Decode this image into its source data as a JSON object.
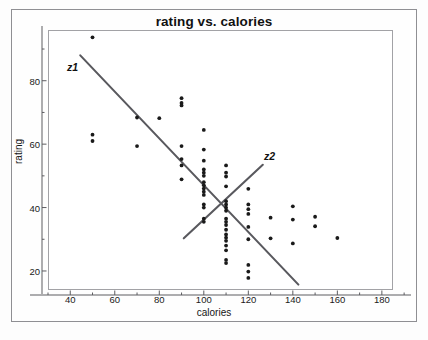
{
  "chart_data": {
    "type": "scatter",
    "title": "rating vs. calories",
    "xlabel": "calories",
    "ylabel": "rating",
    "xlim": [
      30,
      185
    ],
    "ylim": [
      14,
      96
    ],
    "xticks": [
      40,
      60,
      80,
      100,
      120,
      140,
      160,
      180
    ],
    "yticks": [
      20,
      40,
      60,
      80
    ],
    "grid": false,
    "legend": "none",
    "point_color": "#1a1a1a",
    "line_color": "#59595e",
    "points": [
      [
        50,
        93.7
      ],
      [
        50,
        63.0
      ],
      [
        50,
        61.0
      ],
      [
        70,
        68.4
      ],
      [
        70,
        59.4
      ],
      [
        80,
        68.2
      ],
      [
        90,
        74.5
      ],
      [
        90,
        73.0
      ],
      [
        90,
        72.2
      ],
      [
        90,
        59.4
      ],
      [
        90,
        55.3
      ],
      [
        90,
        53.3
      ],
      [
        90,
        48.9
      ],
      [
        100,
        64.5
      ],
      [
        100,
        58.3
      ],
      [
        100,
        54.8
      ],
      [
        100,
        52.0
      ],
      [
        100,
        51.0
      ],
      [
        100,
        50.0
      ],
      [
        100,
        48.0
      ],
      [
        100,
        47.0
      ],
      [
        100,
        46.0
      ],
      [
        100,
        45.0
      ],
      [
        100,
        44.0
      ],
      [
        100,
        41.0
      ],
      [
        100,
        40.0
      ],
      [
        100,
        36.5
      ],
      [
        100,
        35.5
      ],
      [
        110,
        53.3
      ],
      [
        110,
        51.0
      ],
      [
        110,
        49.8
      ],
      [
        110,
        46.7
      ],
      [
        110,
        42.0
      ],
      [
        110,
        41.0
      ],
      [
        110,
        40.0
      ],
      [
        110,
        39.0
      ],
      [
        110,
        36.5
      ],
      [
        110,
        35.5
      ],
      [
        110,
        34.5
      ],
      [
        110,
        33.0
      ],
      [
        110,
        31.5
      ],
      [
        110,
        30.5
      ],
      [
        110,
        29.5
      ],
      [
        110,
        28.0
      ],
      [
        110,
        26.5
      ],
      [
        110,
        23.5
      ],
      [
        110,
        22.5
      ],
      [
        120,
        45.9
      ],
      [
        120,
        41.0
      ],
      [
        120,
        39.5
      ],
      [
        120,
        38.0
      ],
      [
        120,
        33.9
      ],
      [
        120,
        30.0
      ],
      [
        120,
        21.9
      ],
      [
        120,
        19.8
      ],
      [
        120,
        17.8
      ],
      [
        130,
        36.8
      ],
      [
        130,
        30.3
      ],
      [
        140,
        40.4
      ],
      [
        140,
        36.2
      ],
      [
        140,
        28.7
      ],
      [
        150,
        37.1
      ],
      [
        150,
        34.1
      ],
      [
        160,
        30.4
      ]
    ],
    "lines": [
      {
        "label": "z1",
        "direction": "descending",
        "x_start": 44.5,
        "y_start": 88.0,
        "x_end": 142.5,
        "y_end": 15.7
      },
      {
        "label": "z2",
        "direction": "ascending",
        "x_start": 91.0,
        "y_start": 30.3,
        "x_end": 126.5,
        "y_end": 53.5
      }
    ]
  }
}
